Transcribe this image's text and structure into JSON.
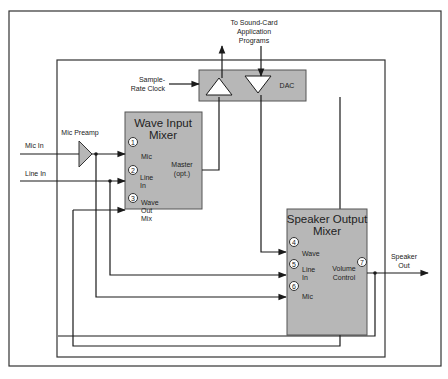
{
  "diagram": {
    "top_label": [
      "To Sound-Card",
      "Application",
      "Programs"
    ],
    "sample_rate_label": [
      "Sample-",
      "Rate Clock"
    ],
    "dac_label": "DAC",
    "mic_preamp_label": "Mic Preamp",
    "inputs": {
      "mic_in": "Mic In",
      "line_in": "Line In"
    },
    "wave_input_mixer": {
      "title": [
        "Wave Input",
        "Mixer"
      ],
      "channels": [
        {
          "num": "1",
          "label": [
            "Mic"
          ]
        },
        {
          "num": "2",
          "label": [
            "Line",
            "In"
          ]
        },
        {
          "num": "3",
          "label": [
            "Wave",
            "Out",
            "Mix"
          ]
        }
      ],
      "master_label": [
        "Master",
        "(opt.)"
      ]
    },
    "speaker_output_mixer": {
      "title": [
        "Speaker Output",
        "Mixer"
      ],
      "channels": [
        {
          "num": "4",
          "label": [
            "Wave"
          ]
        },
        {
          "num": "5",
          "label": [
            "Line",
            "In"
          ]
        },
        {
          "num": "6",
          "label": [
            "Mic"
          ]
        }
      ],
      "volume": {
        "num": "7",
        "label": [
          "Volume",
          "Control"
        ]
      }
    },
    "speaker_out_label": [
      "Speaker",
      "Out"
    ]
  },
  "colors": {
    "box_fill": "#b7b7b7",
    "line": "#1a1a1a",
    "background": "#ffffff"
  }
}
